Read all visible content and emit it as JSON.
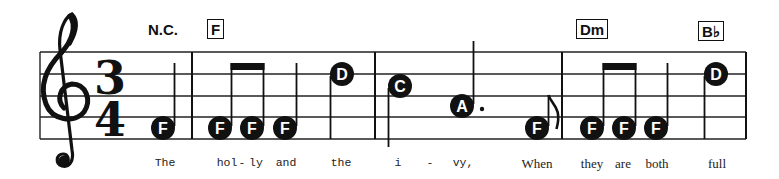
{
  "score": {
    "clef": "treble",
    "time_signature": {
      "numerator": "3",
      "denominator": "4"
    },
    "staff": {
      "x_start": 40,
      "x_end": 746,
      "lines_y": [
        52,
        74,
        96,
        117,
        139
      ]
    },
    "barlines_x": [
      192,
      375,
      562,
      746
    ],
    "chords": [
      {
        "label": "N.C.",
        "boxed": false,
        "x": 148,
        "y": 22
      },
      {
        "label": "F",
        "boxed": true,
        "x": 207,
        "y": 19
      },
      {
        "label": "Dm",
        "boxed": true,
        "x": 576,
        "y": 19
      },
      {
        "label": "B♭",
        "boxed": true,
        "x": 698,
        "y": 21
      }
    ],
    "notes": [
      {
        "name": "F",
        "x": 163,
        "y": 128,
        "stem": "up",
        "duration": "quarter"
      },
      {
        "name": "F",
        "x": 220,
        "y": 128,
        "stem": "up",
        "duration": "eighth",
        "beam": 1
      },
      {
        "name": "F",
        "x": 252,
        "y": 128,
        "stem": "up",
        "duration": "eighth",
        "beam": 1
      },
      {
        "name": "F",
        "x": 285,
        "y": 128,
        "stem": "up",
        "duration": "quarter"
      },
      {
        "name": "D",
        "x": 342,
        "y": 74,
        "stem": "down",
        "duration": "quarter"
      },
      {
        "name": "C",
        "x": 400,
        "y": 86,
        "stem": "down",
        "duration": "quarter"
      },
      {
        "name": "A",
        "x": 462,
        "y": 106,
        "stem": "up",
        "duration": "dotted-quarter",
        "dot": true
      },
      {
        "name": "F",
        "x": 537,
        "y": 128,
        "stem": "up",
        "duration": "eighth",
        "flag": true
      },
      {
        "name": "F",
        "x": 592,
        "y": 128,
        "stem": "up",
        "duration": "eighth",
        "beam": 2
      },
      {
        "name": "F",
        "x": 624,
        "y": 128,
        "stem": "up",
        "duration": "eighth",
        "beam": 2
      },
      {
        "name": "F",
        "x": 656,
        "y": 128,
        "stem": "up",
        "duration": "quarter"
      },
      {
        "name": "D",
        "x": 716,
        "y": 74,
        "stem": "down",
        "duration": "quarter"
      }
    ],
    "lyrics": [
      {
        "text": "The",
        "x": 165
      },
      {
        "text": "hol",
        "x": 227
      },
      {
        "text": "-",
        "x": 242
      },
      {
        "text": "ly",
        "x": 256
      },
      {
        "text": "and",
        "x": 286
      },
      {
        "text": "the",
        "x": 341
      },
      {
        "text": "i",
        "x": 398
      },
      {
        "text": "-",
        "x": 430
      },
      {
        "text": "vy,",
        "x": 463
      },
      {
        "text": "When",
        "x": 537
      },
      {
        "text": "they",
        "x": 592
      },
      {
        "text": "are",
        "x": 623
      },
      {
        "text": "both",
        "x": 657
      },
      {
        "text": "full",
        "x": 717
      }
    ]
  }
}
